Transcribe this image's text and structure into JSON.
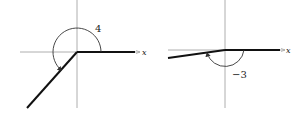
{
  "figures": [
    {
      "id": "left",
      "angle_label": "4",
      "axis_label": "x",
      "origin": [
        77,
        52
      ],
      "terminal_end": [
        27,
        108
      ],
      "direction": "counterclockwise"
    },
    {
      "id": "right",
      "angle_label": "−3",
      "axis_label": "x",
      "origin": [
        225,
        50
      ],
      "terminal_end": [
        168,
        58
      ],
      "direction": "clockwise"
    }
  ],
  "colors": {
    "axis": "#9a9a9a",
    "ray": "#111111",
    "arc": "#333333"
  }
}
